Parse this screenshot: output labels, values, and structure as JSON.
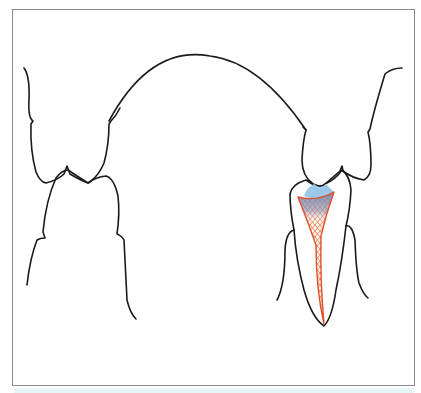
{
  "figure": {
    "colors": {
      "outline": "#1a1a1a",
      "frame": "#8c8c8c",
      "lesion_fill": "#9cc8ea",
      "pulp_stroke": "#e0502a",
      "pulp_mesh": "#e7743e",
      "pulp_upper_fill": "#7f8fb3",
      "bottom_strip": "#e8f6f6"
    }
  }
}
